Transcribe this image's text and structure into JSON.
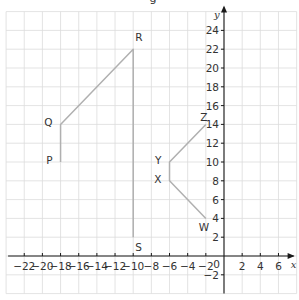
{
  "caption_fragment": "g",
  "axes": {
    "x_label": "x",
    "y_label": "y",
    "x_range": [
      -24,
      8
    ],
    "y_range": [
      -4,
      26
    ],
    "grid_step": 2,
    "origin_label": "0",
    "x_ticks": [
      -22,
      -20,
      -18,
      -16,
      -14,
      -12,
      -10,
      -8,
      -6,
      -4,
      -2,
      2,
      4,
      6
    ],
    "y_ticks": [
      24,
      22,
      20,
      18,
      16,
      14,
      12,
      10,
      8,
      6,
      4,
      2,
      -2
    ]
  },
  "shapes": [
    {
      "name": "PQRS",
      "vertices": [
        {
          "label": "P",
          "x": -18,
          "y": 10,
          "label_pos": "left"
        },
        {
          "label": "Q",
          "x": -18,
          "y": 14,
          "label_pos": "left"
        },
        {
          "label": "R",
          "x": -10,
          "y": 22,
          "label_pos": "above-right"
        },
        {
          "label": "S",
          "x": -10,
          "y": 2,
          "label_pos": "below-right"
        }
      ]
    },
    {
      "name": "WXYZ",
      "vertices": [
        {
          "label": "W",
          "x": -2,
          "y": 4,
          "label_pos": "below"
        },
        {
          "label": "X",
          "x": -6,
          "y": 8,
          "label_pos": "left"
        },
        {
          "label": "Y",
          "x": -6,
          "y": 10,
          "label_pos": "left"
        },
        {
          "label": "Z",
          "x": -2,
          "y": 14,
          "label_pos": "above"
        }
      ]
    }
  ]
}
